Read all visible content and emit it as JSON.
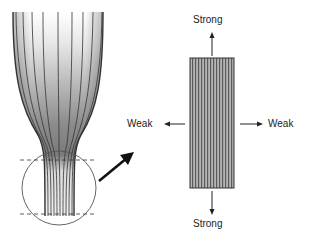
{
  "labels": {
    "top": "Strong",
    "bottom": "Strong",
    "left": "Weak",
    "right": "Weak"
  },
  "colors": {
    "fiber_line": "#333333",
    "fill_dark": "#8a8a8a",
    "fill_light": "#f4f4f4",
    "rect_fill": "#9a9a9a",
    "arrow": "#111111"
  }
}
